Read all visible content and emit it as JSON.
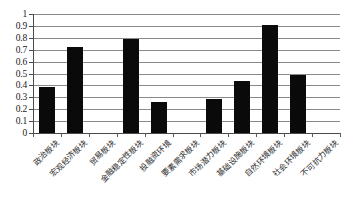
{
  "chart_data": {
    "type": "bar",
    "title": "",
    "subtitle": "",
    "xlabel": "",
    "ylabel": "",
    "ylim": [
      0,
      1
    ],
    "ytick_values": [
      0,
      0.1,
      0.2,
      0.3,
      0.4,
      0.5,
      0.6,
      0.7,
      0.8,
      0.9,
      1
    ],
    "ytick_labels": [
      "0",
      "0.1",
      "0.2",
      "0.3",
      "0.4",
      "0.5",
      "0.6",
      "0.7",
      "0.8",
      "0.9",
      "1"
    ],
    "grid": true,
    "legend": false,
    "legend_position": "none",
    "bar_color": "#0a0a0a",
    "categories": [
      "政治板块",
      "宏观经济板块",
      "贸易板块",
      "金融稳定性板块",
      "投融资环境",
      "要素需求板块",
      "市场潜力板块",
      "基础设施板块",
      "自然环境板块",
      "社会环境板块",
      "不可抗力板块"
    ],
    "values": [
      0.39,
      0.72,
      0,
      0.79,
      0.26,
      0,
      0.29,
      0.44,
      0.91,
      0.49,
      0
    ]
  }
}
